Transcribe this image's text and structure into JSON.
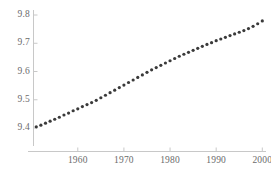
{
  "chart_data": {
    "type": "scatter",
    "title": "",
    "subtitle": "",
    "xlabel": "",
    "ylabel": "",
    "xlim": [
      1950.4,
      2000.8
    ],
    "ylim": [
      9.355,
      9.805
    ],
    "grid": false,
    "legend": null,
    "legend_position": "none",
    "marker": {
      "shape": "circle",
      "color": "#3a3a3a",
      "size_px": 3.2,
      "filled": true
    },
    "x_ticks": [
      1960,
      1970,
      1980,
      1990,
      2000
    ],
    "x_tick_labels": [
      "1960",
      "1970",
      "1980",
      "1990",
      "2000"
    ],
    "y_ticks": [
      9.4,
      9.5,
      9.6,
      9.7,
      9.8
    ],
    "y_tick_labels": [
      "9.4",
      "9.5",
      "9.6",
      "9.7",
      "9.8"
    ],
    "axis_color": "#c8c8c8",
    "tick_label_color": "#6b6b6b",
    "background_color": "#ffffff",
    "x": [
      1951,
      1952,
      1953,
      1954,
      1955,
      1956,
      1957,
      1958,
      1959,
      1960,
      1961,
      1962,
      1963,
      1964,
      1965,
      1966,
      1967,
      1968,
      1969,
      1970,
      1971,
      1972,
      1973,
      1974,
      1975,
      1976,
      1977,
      1978,
      1979,
      1980,
      1981,
      1982,
      1983,
      1984,
      1985,
      1986,
      1987,
      1988,
      1989,
      1990,
      1991,
      1992,
      1993,
      1994,
      1995,
      1996,
      1997,
      1998,
      1999,
      2000
    ],
    "values": [
      9.404,
      9.41,
      9.417,
      9.424,
      9.431,
      9.438,
      9.446,
      9.453,
      9.461,
      9.468,
      9.476,
      9.483,
      9.49,
      9.498,
      9.507,
      9.516,
      9.525,
      9.534,
      9.543,
      9.552,
      9.561,
      9.57,
      9.579,
      9.588,
      9.597,
      9.606,
      9.614,
      9.622,
      9.63,
      9.638,
      9.646,
      9.654,
      9.661,
      9.668,
      9.675,
      9.682,
      9.689,
      9.696,
      9.702,
      9.709,
      9.715,
      9.721,
      9.727,
      9.733,
      9.739,
      9.745,
      9.752,
      9.76,
      9.769,
      9.779
    ]
  }
}
